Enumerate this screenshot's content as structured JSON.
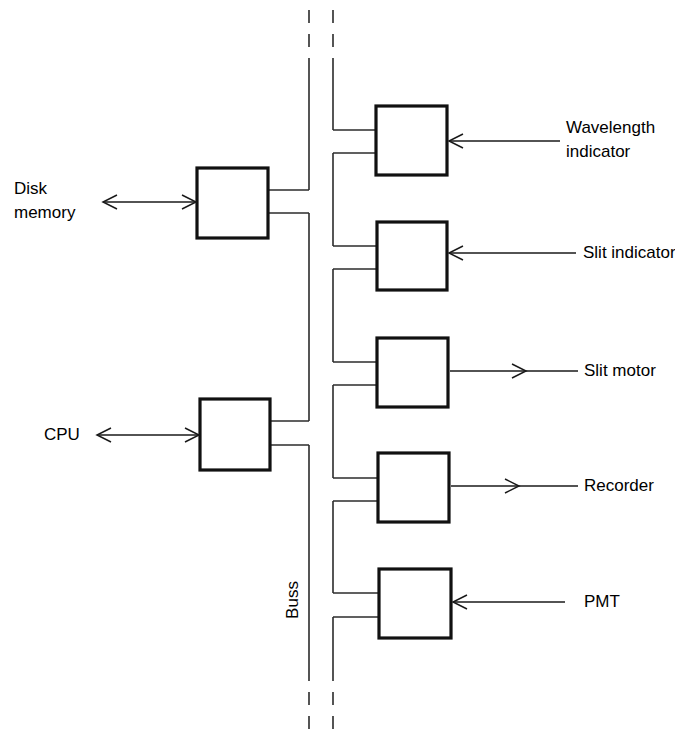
{
  "diagram": {
    "bus_label": "Buss",
    "background_color": "#ffffff",
    "line_color": "#2b2b2b",
    "box_stroke_color": "#111111",
    "left_units": [
      {
        "id": "disk-memory",
        "label_line1": "Disk",
        "label_line2": "memory",
        "arrow": "bidirectional"
      },
      {
        "id": "cpu",
        "label_line1": "CPU",
        "label_line2": "",
        "arrow": "bidirectional"
      }
    ],
    "right_units": [
      {
        "id": "wavelength-indicator",
        "label_line1": "Wavelength",
        "label_line2": "indicator",
        "arrow": "into-box"
      },
      {
        "id": "slit-indicator",
        "label_line1": "Slit indicator",
        "label_line2": "",
        "arrow": "into-box"
      },
      {
        "id": "slit-motor",
        "label_line1": "Slit motor",
        "label_line2": "",
        "arrow": "out-of-box"
      },
      {
        "id": "recorder",
        "label_line1": "Recorder",
        "label_line2": "",
        "arrow": "out-of-box"
      },
      {
        "id": "pmt",
        "label_line1": "PMT",
        "label_line2": "",
        "arrow": "into-box"
      }
    ]
  }
}
